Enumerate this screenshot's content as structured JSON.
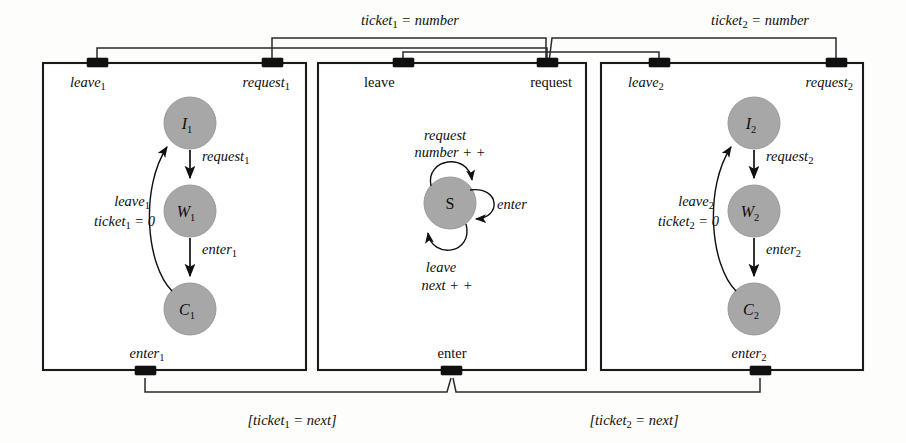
{
  "figure": {
    "background_color": "#fdfdfb",
    "state_fill_color": "#a7a7a7",
    "line_color": "#101010"
  },
  "boxes": [
    {
      "id": "process-1",
      "ports": {
        "top_left": "leave₁",
        "top_left_base": "leave",
        "top_left_sub": "1",
        "top_right_base": "request",
        "top_right_sub": "1",
        "bottom_base": "enter",
        "bottom_sub": "1"
      },
      "states": [
        {
          "id": "I1",
          "base": "I",
          "sub": "1"
        },
        {
          "id": "W1",
          "base": "W",
          "sub": "1"
        },
        {
          "id": "C1",
          "base": "C",
          "sub": "1"
        }
      ],
      "transitions": [
        {
          "from": "I1",
          "to": "W1",
          "label_base": "request",
          "label_sub": "1"
        },
        {
          "from": "W1",
          "to": "C1",
          "label_base": "enter",
          "label_sub": "1"
        },
        {
          "from": "C1",
          "to": "I1",
          "label_base": "leave",
          "label_sub": "1",
          "label_line2": "ticket₁ = 0",
          "label_line2_base": "ticket",
          "label_line2_sub": "1",
          "label_line2_tail": " = 0"
        }
      ]
    },
    {
      "id": "ticket-server",
      "ports": {
        "top_left_base": "leave",
        "top_left_sub": "",
        "top_right_base": "request",
        "top_right_sub": "",
        "bottom_base": "enter",
        "bottom_sub": ""
      },
      "states": [
        {
          "id": "S",
          "base": "S",
          "sub": ""
        }
      ],
      "transitions": [
        {
          "from": "S",
          "to": "S",
          "label_line1": "request",
          "label_line2": "number + +",
          "position": "top"
        },
        {
          "from": "S",
          "to": "S",
          "label_line1": "enter",
          "label_line2": "",
          "position": "right"
        },
        {
          "from": "S",
          "to": "S",
          "label_line1": "leave",
          "label_line2": "next + +",
          "position": "bottom"
        }
      ]
    },
    {
      "id": "process-2",
      "ports": {
        "top_left_base": "leave",
        "top_left_sub": "2",
        "top_right_base": "request",
        "top_right_sub": "2",
        "bottom_base": "enter",
        "bottom_sub": "2"
      },
      "states": [
        {
          "id": "I2",
          "base": "I",
          "sub": "2"
        },
        {
          "id": "W2",
          "base": "W",
          "sub": "2"
        },
        {
          "id": "C2",
          "base": "C",
          "sub": "2"
        }
      ],
      "transitions": [
        {
          "from": "I2",
          "to": "W2",
          "label_base": "request",
          "label_sub": "2"
        },
        {
          "from": "W2",
          "to": "C2",
          "label_base": "enter",
          "label_sub": "2"
        },
        {
          "from": "C2",
          "to": "I2",
          "label_base": "leave",
          "label_sub": "2",
          "label_line2_base": "ticket",
          "label_line2_sub": "2",
          "label_line2_tail": " = 0"
        }
      ]
    }
  ],
  "connectors": [
    {
      "id": "ticket1-number",
      "label_base": "ticket",
      "label_sub": "1",
      "label_tail": " = number",
      "position": "top-left"
    },
    {
      "id": "ticket2-number",
      "label_base": "ticket",
      "label_sub": "2",
      "label_tail": " = number",
      "position": "top-right"
    },
    {
      "id": "ticket1-next",
      "label_open": "[",
      "label_base": "ticket",
      "label_sub": "1",
      "label_tail": " = next]",
      "position": "bottom-left"
    },
    {
      "id": "ticket2-next",
      "label_open": "[",
      "label_base": "ticket",
      "label_sub": "2",
      "label_tail": " = next]",
      "position": "bottom-right"
    }
  ],
  "labels": {
    "p1_top_left": "leave",
    "p1_top_left_sub": "1",
    "p1_top_right": "request",
    "p1_top_right_sub": "1",
    "p1_bottom": "enter",
    "p1_bottom_sub": "1",
    "srv_top_left": "leave",
    "srv_top_right": "request",
    "srv_bottom": "enter",
    "p2_top_left": "leave",
    "p2_top_left_sub": "2",
    "p2_top_right": "request",
    "p2_top_right_sub": "2",
    "p2_bottom": "enter",
    "p2_bottom_sub": "2",
    "p1_e_req": "request",
    "p1_e_req_sub": "1",
    "p1_e_ent": "enter",
    "p1_e_ent_sub": "1",
    "p1_e_lv": "leave",
    "p1_e_lv_sub": "1",
    "p1_e_tkt": "ticket",
    "p1_e_tkt_sub": "1",
    "p1_e_tkt_tail": " = 0",
    "p2_e_req": "request",
    "p2_e_req_sub": "2",
    "p2_e_ent": "enter",
    "p2_e_ent_sub": "2",
    "p2_e_lv": "leave",
    "p2_e_lv_sub": "2",
    "p2_e_tkt": "ticket",
    "p2_e_tkt_sub": "2",
    "p2_e_tkt_tail": " = 0",
    "srv_req": "request",
    "srv_numpp": "number + +",
    "srv_enter": "enter",
    "srv_leave": "leave",
    "srv_nextpp": "next + +",
    "st_I1": "I",
    "st_I1_sub": "1",
    "st_W1": "W",
    "st_W1_sub": "1",
    "st_C1": "C",
    "st_C1_sub": "1",
    "st_S": "S",
    "st_I2": "I",
    "st_I2_sub": "2",
    "st_W2": "W",
    "st_W2_sub": "2",
    "st_C2": "C",
    "st_C2_sub": "2",
    "conn_t1": "ticket",
    "conn_t1_sub": "1",
    "conn_t1_tail": " = number",
    "conn_t2": "ticket",
    "conn_t2_sub": "2",
    "conn_t2_tail": " = number",
    "conn_b1_open": "[",
    "conn_b1": "ticket",
    "conn_b1_sub": "1",
    "conn_b1_tail": " = next]",
    "conn_b2_open": "[",
    "conn_b2": "ticket",
    "conn_b2_sub": "2",
    "conn_b2_tail": " = next]"
  }
}
